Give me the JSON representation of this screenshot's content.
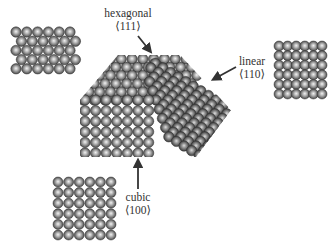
{
  "diagram": {
    "colors": {
      "background": "#ffffff",
      "atom_fill_light": "#e8e8e8",
      "atom_fill_mid": "#9a9a9a",
      "atom_fill_dark": "#4a4a4a",
      "atom_edge": "#2e2e2e",
      "arrow": "#333333",
      "text": "#333333"
    },
    "labels": {
      "hexagonal": {
        "name": "hexagonal",
        "index": "⟨111⟩"
      },
      "linear": {
        "name": "linear",
        "index": "⟨110⟩"
      },
      "cubic": {
        "name": "cubic",
        "index": "⟨100⟩"
      }
    },
    "panels": [
      {
        "id": "hexagonal-surface",
        "arrangement": "hexagonal",
        "rows": 5,
        "cols": 6
      },
      {
        "id": "linear-surface",
        "arrangement": "linear",
        "rows": 6,
        "cols": 6
      },
      {
        "id": "cubic-surface",
        "arrangement": "cubic",
        "rows": 6,
        "cols": 6
      }
    ],
    "main_crystal": {
      "description": "truncated nanocrystal of spherical atoms with cubic front face, hexagonal top-left facet and linear right facet"
    }
  }
}
